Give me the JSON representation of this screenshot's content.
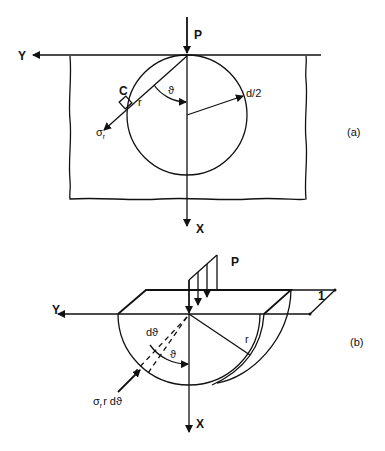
{
  "figure_a": {
    "label": "(a)",
    "load": "P",
    "axis_y": "Y",
    "axis_x": "X",
    "point": "C",
    "radius_label": "r",
    "angle_label": "ϑ",
    "diameter_label": "d/2",
    "stress_label": "σ",
    "stress_sub": "r"
  },
  "figure_b": {
    "label": "(b)",
    "load": "P",
    "axis_y": "Y",
    "axis_x": "X",
    "thickness_label": "1",
    "radius_label": "r",
    "dtheta_label": "dϑ",
    "angle_label": "ϑ",
    "force_label_pre": "σ",
    "force_label_sub": "r",
    "force_label_post": "r dϑ"
  }
}
